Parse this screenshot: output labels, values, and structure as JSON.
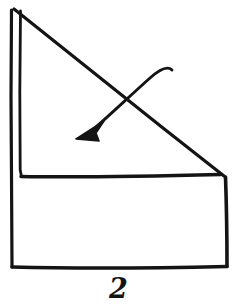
{
  "figure": {
    "kind": "hand-drawn-fold-diagram",
    "caption": "2",
    "ink_color": "#141414",
    "background_color": "#ffffff",
    "line_weight": 3,
    "width": 237,
    "height": 307,
    "shapes": {
      "outer_left_edge": {
        "name": "outer-left-vertical-edge",
        "path": "M 11.5 10 L 11.0 96 L 11.5 176 L 12.0 267"
      },
      "inner_left_edge": {
        "name": "inner-left-vertical-edge",
        "path": "M 20.5 11 L 19.8 92 L 20.2 170 L 21.5 176.5"
      },
      "diagonal_fold_edge": {
        "name": "diagonal-hypotenuse-edge",
        "path": "M 14 9 C 60 46, 150 118, 224 176"
      },
      "inner_horizontal_edge": {
        "name": "inner-horizontal-edge",
        "path": "M 21 176.5 C 80 177.5, 160 176, 221 174.5"
      },
      "right_vertical_edge": {
        "name": "right-vertical-edge",
        "path": "M 225.5 177 C 226.5 205, 227 240, 227 266.5"
      },
      "bottom_edge": {
        "name": "bottom-horizontal-edge",
        "path": "M 12 267 C 70 268.5, 160 268, 227 266.5"
      },
      "arrow_shaft": {
        "name": "fold-arrow-shaft",
        "path": "M 172 70 C 168 66, 160 69, 150 78 C 132 94, 110 115, 96 127"
      },
      "arrow_head": {
        "name": "fold-arrow-head",
        "points": "76,139 104,121 96,133 99,141"
      }
    }
  }
}
